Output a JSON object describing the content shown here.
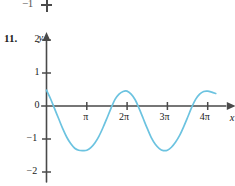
{
  "figure": {
    "problem_number": "11.",
    "cropped_fragment_above": {
      "label": "−1",
      "note": "partial tick and label from the figure above"
    },
    "axis_labels": {
      "x": "x",
      "y": "y"
    },
    "y_ticks": [
      {
        "value": 2,
        "label": "2"
      },
      {
        "value": 1,
        "label": "1"
      },
      {
        "value": 0,
        "label": "0"
      },
      {
        "value": -1,
        "label": "−1"
      },
      {
        "value": -2,
        "label": "−2"
      }
    ],
    "x_ticks": [
      {
        "value": 0,
        "label": ""
      },
      {
        "value": 1,
        "label": "π"
      },
      {
        "value": 2,
        "label": "2π"
      },
      {
        "value": 3,
        "label": "3π"
      },
      {
        "value": 4,
        "label": "4π"
      }
    ],
    "curve_color": "#6cc3e0",
    "axis_color": "#4a4a4a"
  },
  "chart_data": {
    "type": "line",
    "title": "",
    "xlabel": "x",
    "ylabel": "y",
    "xlim": [
      -0.12,
      4.45
    ],
    "ylim": [
      -2.3,
      2.3
    ],
    "x_unit": "pi",
    "grid": false,
    "legend": null,
    "series": [
      {
        "name": "y = 0.9 cos(x + 1.05) - 0.45",
        "amplitude": 0.9,
        "period_in_pi": 2,
        "vertical_shift": -0.45,
        "phase_shift_rad": 1.05,
        "y_intercept": 0.48,
        "maxima": [
          {
            "x_in_pi": 1.98,
            "y": 0.45
          },
          {
            "x_in_pi": 3.98,
            "y": 0.45
          }
        ],
        "minima": [
          {
            "x_in_pi": 0.98,
            "y": -1.35
          },
          {
            "x_in_pi": 2.98,
            "y": -1.35
          }
        ],
        "zero_crossings_in_pi": [
          0.17,
          1.8,
          2.17,
          3.8
        ],
        "points": [
          {
            "x_in_pi": 0.0,
            "y": 0.48
          },
          {
            "x_in_pi": 0.1,
            "y": 0.22
          },
          {
            "x_in_pi": 0.2,
            "y": -0.08
          },
          {
            "x_in_pi": 0.3,
            "y": -0.38
          },
          {
            "x_in_pi": 0.4,
            "y": -0.68
          },
          {
            "x_in_pi": 0.5,
            "y": -0.94
          },
          {
            "x_in_pi": 0.6,
            "y": -1.14
          },
          {
            "x_in_pi": 0.7,
            "y": -1.28
          },
          {
            "x_in_pi": 0.8,
            "y": -1.34
          },
          {
            "x_in_pi": 0.9,
            "y": -1.35
          },
          {
            "x_in_pi": 1.0,
            "y": -1.34
          },
          {
            "x_in_pi": 1.1,
            "y": -1.26
          },
          {
            "x_in_pi": 1.2,
            "y": -1.12
          },
          {
            "x_in_pi": 1.3,
            "y": -0.92
          },
          {
            "x_in_pi": 1.4,
            "y": -0.66
          },
          {
            "x_in_pi": 1.5,
            "y": -0.37
          },
          {
            "x_in_pi": 1.6,
            "y": -0.07
          },
          {
            "x_in_pi": 1.7,
            "y": 0.2
          },
          {
            "x_in_pi": 1.8,
            "y": 0.36
          },
          {
            "x_in_pi": 1.9,
            "y": 0.44
          },
          {
            "x_in_pi": 2.0,
            "y": 0.45
          },
          {
            "x_in_pi": 2.1,
            "y": 0.36
          },
          {
            "x_in_pi": 2.2,
            "y": 0.19
          },
          {
            "x_in_pi": 2.3,
            "y": -0.08
          },
          {
            "x_in_pi": 2.4,
            "y": -0.38
          },
          {
            "x_in_pi": 2.5,
            "y": -0.68
          },
          {
            "x_in_pi": 2.6,
            "y": -0.96
          },
          {
            "x_in_pi": 2.7,
            "y": -1.16
          },
          {
            "x_in_pi": 2.8,
            "y": -1.29
          },
          {
            "x_in_pi": 2.9,
            "y": -1.35
          },
          {
            "x_in_pi": 3.0,
            "y": -1.34
          },
          {
            "x_in_pi": 3.1,
            "y": -1.25
          },
          {
            "x_in_pi": 3.2,
            "y": -1.1
          },
          {
            "x_in_pi": 3.3,
            "y": -0.9
          },
          {
            "x_in_pi": 3.4,
            "y": -0.64
          },
          {
            "x_in_pi": 3.5,
            "y": -0.35
          },
          {
            "x_in_pi": 3.6,
            "y": -0.05
          },
          {
            "x_in_pi": 3.7,
            "y": 0.2
          },
          {
            "x_in_pi": 3.8,
            "y": 0.36
          },
          {
            "x_in_pi": 3.9,
            "y": 0.44
          },
          {
            "x_in_pi": 4.0,
            "y": 0.45
          },
          {
            "x_in_pi": 4.1,
            "y": 0.42
          },
          {
            "x_in_pi": 4.2,
            "y": 0.38
          }
        ]
      }
    ]
  }
}
